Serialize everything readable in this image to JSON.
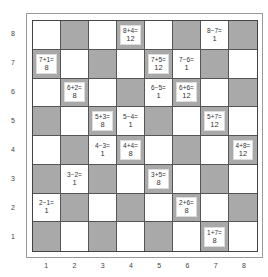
{
  "board": {
    "columns": [
      "1",
      "2",
      "3",
      "4",
      "5",
      "6",
      "7",
      "8"
    ],
    "rows": [
      "8",
      "7",
      "6",
      "5",
      "4",
      "3",
      "2",
      "1"
    ],
    "colors": {
      "dark": "#a9a9a9",
      "light": "#ffffff",
      "grid_line": "#555555"
    },
    "equations": [
      {
        "col": 4,
        "row": 8,
        "expr": "8+4=",
        "result": "12",
        "square": "dark"
      },
      {
        "col": 7,
        "row": 8,
        "expr": "8−7=",
        "result": "1",
        "square": "light"
      },
      {
        "col": 1,
        "row": 7,
        "expr": "7+1=",
        "result": "8",
        "square": "dark"
      },
      {
        "col": 5,
        "row": 7,
        "expr": "7+5=",
        "result": "12",
        "square": "dark"
      },
      {
        "col": 6,
        "row": 7,
        "expr": "7−6=",
        "result": "1",
        "square": "light"
      },
      {
        "col": 2,
        "row": 6,
        "expr": "6+2=",
        "result": "8",
        "square": "dark"
      },
      {
        "col": 5,
        "row": 6,
        "expr": "6−5=",
        "result": "1",
        "square": "light"
      },
      {
        "col": 6,
        "row": 6,
        "expr": "6+6=",
        "result": "12",
        "square": "dark"
      },
      {
        "col": 3,
        "row": 5,
        "expr": "5+3=",
        "result": "8",
        "square": "dark"
      },
      {
        "col": 4,
        "row": 5,
        "expr": "5−4=",
        "result": "1",
        "square": "light"
      },
      {
        "col": 7,
        "row": 5,
        "expr": "5+7=",
        "result": "12",
        "square": "dark"
      },
      {
        "col": 3,
        "row": 4,
        "expr": "4−3=",
        "result": "1",
        "square": "light"
      },
      {
        "col": 4,
        "row": 4,
        "expr": "4+4=",
        "result": "8",
        "square": "dark"
      },
      {
        "col": 8,
        "row": 4,
        "expr": "4+8=",
        "result": "12",
        "square": "dark"
      },
      {
        "col": 2,
        "row": 3,
        "expr": "3−2=",
        "result": "1",
        "square": "light"
      },
      {
        "col": 5,
        "row": 3,
        "expr": "3+5=",
        "result": "8",
        "square": "dark"
      },
      {
        "col": 1,
        "row": 2,
        "expr": "2−1=",
        "result": "1",
        "square": "light"
      },
      {
        "col": 6,
        "row": 2,
        "expr": "2+6=",
        "result": "8",
        "square": "dark"
      },
      {
        "col": 7,
        "row": 1,
        "expr": "1+7=",
        "result": "8",
        "square": "dark"
      }
    ]
  }
}
